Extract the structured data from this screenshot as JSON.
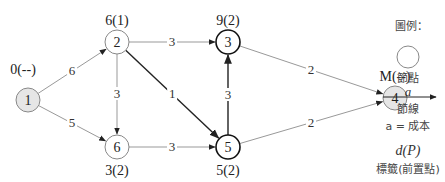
{
  "nodes": [
    {
      "id": "1",
      "label": "0(--)",
      "x": 28,
      "y": 100,
      "fill": "#e6e6e6",
      "bold": false
    },
    {
      "id": "2",
      "label": "6(1)",
      "x": 117,
      "y": 42,
      "fill": "#ffffff",
      "bold": false
    },
    {
      "id": "3",
      "label": "9(2)",
      "x": 228,
      "y": 42,
      "fill": "#ffffff",
      "bold": true
    },
    {
      "id": "4",
      "label": "M(--)",
      "x": 395,
      "y": 98,
      "fill": "#e6e6e6",
      "bold": false
    },
    {
      "id": "5",
      "label": "5(2)",
      "x": 228,
      "y": 147,
      "fill": "#ffffff",
      "bold": true
    },
    {
      "id": "6",
      "label": "3(2)",
      "x": 117,
      "y": 147,
      "fill": "#ffffff",
      "bold": false
    }
  ],
  "edges": [
    {
      "from": "1",
      "to": "2",
      "cost": "6",
      "bold": false
    },
    {
      "from": "1",
      "to": "6",
      "cost": "5",
      "bold": false
    },
    {
      "from": "2",
      "to": "3",
      "cost": "3",
      "bold": false
    },
    {
      "from": "2",
      "to": "6",
      "cost": "3",
      "bold": false
    },
    {
      "from": "2",
      "to": "5",
      "cost": "1",
      "bold": true
    },
    {
      "from": "6",
      "to": "5",
      "cost": "3",
      "bold": false
    },
    {
      "from": "5",
      "to": "3",
      "cost": "3",
      "bold": true
    },
    {
      "from": "3",
      "to": "4",
      "cost": "2",
      "bold": false
    },
    {
      "from": "5",
      "to": "4",
      "cost": "2",
      "bold": false
    }
  ],
  "legend": {
    "title": "圖例：",
    "node_label": "節點",
    "arc_symbol": "a",
    "arc_label": "節線",
    "cost_text": "a = 成本",
    "label_symbol": "d(P)",
    "label_desc": "標籤(前置點)"
  }
}
